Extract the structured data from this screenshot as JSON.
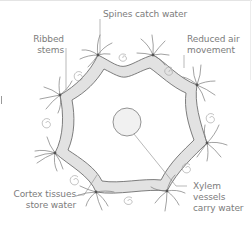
{
  "diagram": {
    "colors": {
      "background": "#ffffff",
      "cortex_fill": "#e2e2e2",
      "outline": "#6f6f6f",
      "label_text": "#7c7c7c",
      "leader_line": "#8a8a8a",
      "spine": "#7a7a7a",
      "swirl": "#a8a8a8",
      "xylem_fill": "#f1f1f1"
    },
    "labels": {
      "spines": "Spines catch water",
      "ribbed_line1": "Ribbed",
      "ribbed_line2": "stems",
      "reduced_line1": "Reduced air",
      "reduced_line2": "movement",
      "cortex_line1": "Cortex tissues",
      "cortex_line2": "store water",
      "xylem_line1": "Xylem",
      "xylem_line2": "vessels",
      "xylem_line3": "carry water"
    },
    "structure": {
      "outer_shape": "8-point ribbed star",
      "spine_clusters": 8,
      "air_swirls": 8,
      "center": "xylem circle"
    }
  }
}
